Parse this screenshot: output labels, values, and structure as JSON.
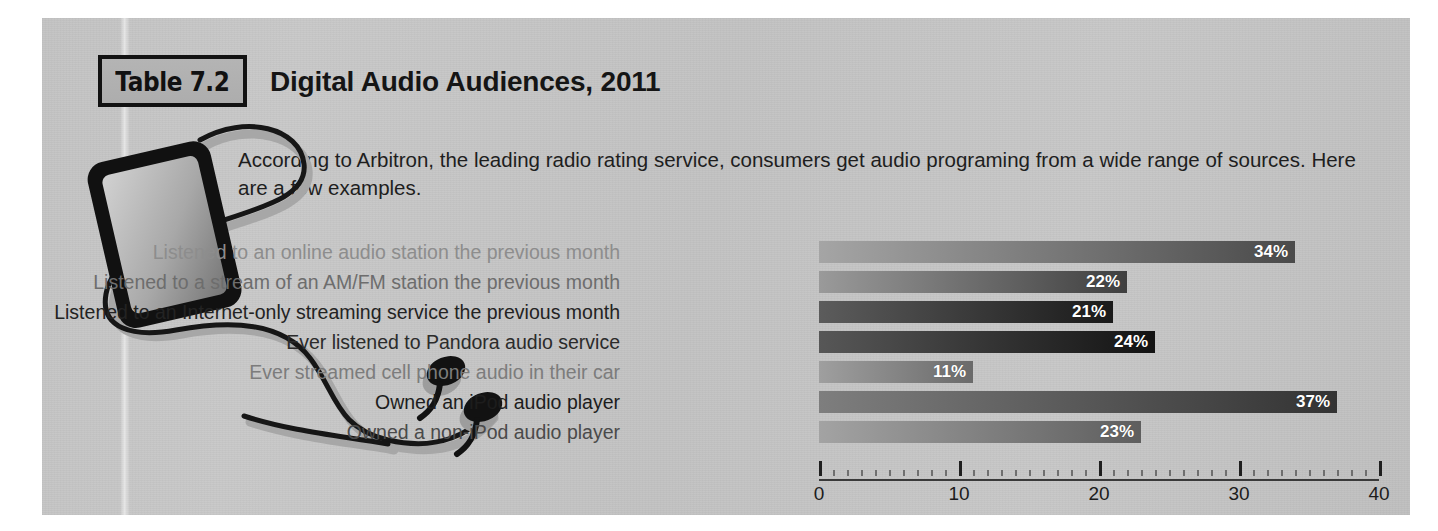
{
  "badge": {
    "label": "Table 7.2"
  },
  "title": "Digital Audio Audiences, 2011",
  "intro": "According to Arbitron, the leading radio rating service, consumers get audio programing from a wide range of sources. Here are a few examples.",
  "illustration": {
    "device_icon": "portable-media-player-icon",
    "earbud_icon": "earbud-icon",
    "cable_icon": "headphone-cable-icon"
  },
  "axis": {
    "ticks": [
      "0",
      "10",
      "20",
      "30",
      "40"
    ],
    "min": 0,
    "max": 40,
    "major_step": 10,
    "minor_step": 1
  },
  "colors": {
    "panel_bg": "#c4c4c4",
    "badge_bg": "#b0b0b0",
    "badge_border": "#121212",
    "bar_light": "#9a9a9a",
    "bar_dark": "#3a3a3a",
    "bar_value_text": "#ffffff",
    "axis_line": "#3a3a3a"
  },
  "chart_data": {
    "type": "bar",
    "title": "Digital Audio Audiences, 2011",
    "xlabel": "",
    "ylabel": "",
    "xlim": [
      0,
      40
    ],
    "grid": false,
    "orientation": "horizontal",
    "legend": "none",
    "value_suffix": "%",
    "categories": [
      "Listened to an online audio station the previous month",
      "Listened to a stream of an AM/FM station the previous month",
      "Listened to an Internet-only streaming service the previous month",
      "Ever listened to Pandora audio service",
      "Ever streamed cell phone audio in their car",
      "Owned an iPod audio player",
      "Owned a non-iPod audio player"
    ],
    "values": [
      34,
      22,
      21,
      24,
      11,
      37,
      23
    ],
    "value_labels": [
      "34%",
      "22%",
      "21%",
      "24%",
      "11%",
      "37%",
      "23%"
    ],
    "bars": [
      {
        "label": "Listened to an online audio station the previous month",
        "value": 34,
        "value_label": "34%",
        "label_color": "#8d8d8d",
        "start_color": "#a5a5a5",
        "end_color": "#4a4a4a"
      },
      {
        "label": "Listened to a stream of an AM/FM station the previous month",
        "value": 22,
        "value_label": "22%",
        "label_color": "#6d6d6d",
        "start_color": "#9a9a9a",
        "end_color": "#3f3f3f"
      },
      {
        "label": "Listened to an Internet-only streaming service the previous month",
        "value": 21,
        "value_label": "21%",
        "label_color": "#232323",
        "start_color": "#5c5c5c",
        "end_color": "#1a1a1a"
      },
      {
        "label": "Ever listened to Pandora audio service",
        "value": 24,
        "value_label": "24%",
        "label_color": "#2b2b2b",
        "start_color": "#575757",
        "end_color": "#131313"
      },
      {
        "label": "Ever streamed cell phone audio in their car",
        "value": 11,
        "value_label": "11%",
        "label_color": "#7c7c7c",
        "start_color": "#9f9f9f",
        "end_color": "#6a6a6a"
      },
      {
        "label": "Owned an iPod audio player",
        "value": 37,
        "value_label": "37%",
        "label_color": "#1d1d1d",
        "start_color": "#7e7e7e",
        "end_color": "#333333"
      },
      {
        "label": "Owned a non-iPod audio player",
        "value": 23,
        "value_label": "23%",
        "label_color": "#4a4a4a",
        "start_color": "#a3a3a3",
        "end_color": "#5e5e5e"
      }
    ]
  }
}
